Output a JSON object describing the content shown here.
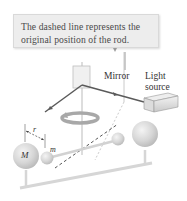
{
  "callout": {
    "line1": "The dashed line represents the",
    "line2": "original position of the rod."
  },
  "labels": {
    "mirror": "Mirror",
    "light_source_line1": "Light",
    "light_source_line2": "source",
    "large_mass": "M",
    "small_mass": "m",
    "distance": "r"
  },
  "colors": {
    "callout_bg": "#ededed",
    "light_beam": "#555555",
    "sphere": "#d4d4d4",
    "rod": "#e0e0e0",
    "rotation_arrow": "#a8a8a8"
  }
}
